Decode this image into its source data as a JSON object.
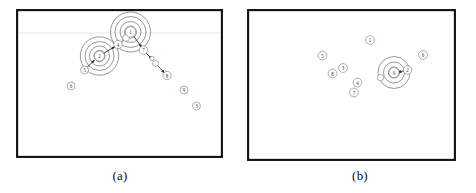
{
  "figure": {
    "type": "two-panel-node-cluster-diagram",
    "background_color": "#ffffff",
    "frame_color": "#101010",
    "node_stroke_color": "#6b6b6b",
    "ring_stroke_color": "#5a5a5a",
    "arrow_color": "#2b2b2b",
    "gridline_color": "#e2e2e2",
    "panels": [
      {
        "id": "a",
        "caption": "(a)",
        "frame": {
          "x": 16,
          "y": 9,
          "width": 207,
          "height": 149
        },
        "gridlines": [
          {
            "orientation": "horizontal",
            "y": 33
          }
        ],
        "clusters": [
          {
            "name": "cluster-node-1",
            "center_label": "1",
            "cx": 130.5,
            "cy": 32.0,
            "ring_radii": [
              6.0,
              10.5,
              15.5,
              20.0
            ],
            "node_radius": 5.2
          },
          {
            "name": "cluster-node-2",
            "center_label": "2",
            "cx": 99.5,
            "cy": 56.0,
            "ring_radii": [
              5.6,
              10.0,
              14.5,
              19.2
            ],
            "node_radius": 5.0
          }
        ],
        "nodes": [
          {
            "label": "1",
            "x": 130.5,
            "y": 32.0,
            "r": 5.2
          },
          {
            "label": "2",
            "x": 99.5,
            "y": 56.0,
            "r": 5.0
          },
          {
            "label": "4",
            "x": 118.0,
            "y": 44.5,
            "r": 4.2
          },
          {
            "label": "7",
            "x": 143.5,
            "y": 50.0,
            "r": 4.2
          },
          {
            "label": "5",
            "x": 84.5,
            "y": 70.0,
            "r": 4.0
          },
          {
            "label": "6",
            "x": 71.0,
            "y": 86.0,
            "r": 4.0
          },
          {
            "label": "8",
            "x": 167.0,
            "y": 75.5,
            "r": 4.2
          },
          {
            "label": "9",
            "x": 184.0,
            "y": 90.0,
            "r": 4.0
          },
          {
            "label": "3",
            "x": 196.5,
            "y": 106.0,
            "r": 4.0
          }
        ],
        "unlabeled_nodes": [
          {
            "name": "waypoint-a1",
            "x": 155.5,
            "y": 63.5,
            "r": 3.0
          },
          {
            "name": "waypoint-a2",
            "x": 152.0,
            "y": 58.5,
            "r": 2.2
          },
          {
            "name": "waypoint-a3",
            "x": 126.0,
            "y": 38.0,
            "r": 3.4
          }
        ],
        "arrows": [
          {
            "name": "arrow-2-to-4",
            "x1": 101.0,
            "y1": 55.0,
            "x2": 115.0,
            "y2": 46.5
          },
          {
            "name": "arrow-4-to-1",
            "x1": 120.5,
            "y1": 43.0,
            "x2": 128.5,
            "y2": 35.5
          },
          {
            "name": "arrow-1-to-7",
            "x1": 133.5,
            "y1": 36.0,
            "x2": 142.0,
            "y2": 47.5
          },
          {
            "name": "arrow-7-to-wp",
            "x1": 145.5,
            "y1": 52.5,
            "x2": 152.0,
            "y2": 59.0
          },
          {
            "name": "arrow-wp-to-8",
            "x1": 157.5,
            "y1": 65.5,
            "x2": 164.5,
            "y2": 73.0
          },
          {
            "name": "arrow-5-to-2",
            "x1": 86.5,
            "y1": 68.0,
            "x2": 94.5,
            "y2": 60.0
          }
        ]
      },
      {
        "id": "b",
        "caption": "(b)",
        "frame": {
          "x": 247,
          "y": 9,
          "width": 209,
          "height": 152
        },
        "gridlines": [],
        "clusters": [
          {
            "name": "cluster-node-9",
            "center_label": "9",
            "cx": 394.0,
            "cy": 72.5,
            "ring_radii": [
              5.6,
              10.5,
              16.0
            ],
            "node_radius": 5.0
          }
        ],
        "nodes": [
          {
            "label": "1",
            "x": 370.0,
            "y": 40.0,
            "r": 4.4
          },
          {
            "label": "5",
            "x": 322.5,
            "y": 55.5,
            "r": 4.4
          },
          {
            "label": "6",
            "x": 423.0,
            "y": 55.0,
            "r": 4.4
          },
          {
            "label": "3",
            "x": 343.0,
            "y": 68.0,
            "r": 4.4
          },
          {
            "label": "8",
            "x": 332.5,
            "y": 73.5,
            "r": 4.4
          },
          {
            "label": "4",
            "x": 357.5,
            "y": 82.5,
            "r": 4.4
          },
          {
            "label": "7",
            "x": 354.0,
            "y": 92.5,
            "r": 4.4
          },
          {
            "label": "9",
            "x": 394.0,
            "y": 72.5,
            "r": 5.0
          },
          {
            "label": "2",
            "x": 407.5,
            "y": 70.0,
            "r": 4.2
          }
        ],
        "unlabeled_nodes": [
          {
            "name": "waypoint-b1",
            "x": 380.5,
            "y": 77.5,
            "r": 3.2
          }
        ],
        "arrows": [
          {
            "name": "arrow-2-to-9",
            "x1": 404.5,
            "y1": 70.8,
            "x2": 398.0,
            "y2": 72.2
          }
        ]
      }
    ]
  }
}
